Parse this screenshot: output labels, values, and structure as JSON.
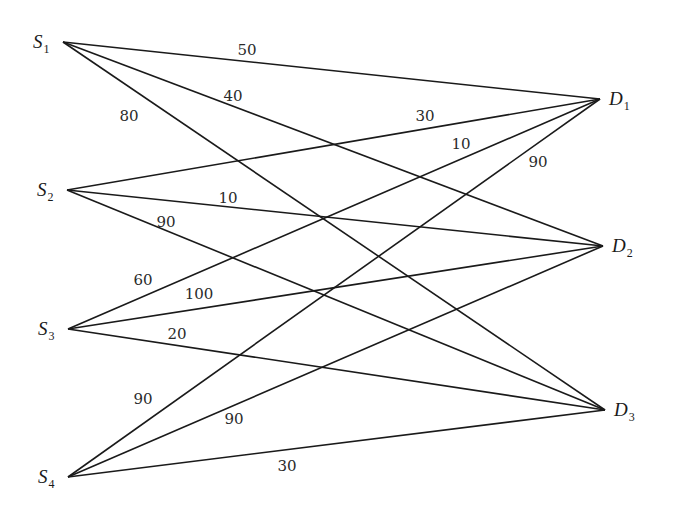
{
  "diagram": {
    "type": "bipartite-network",
    "sources": [
      {
        "id": "S1",
        "letter": "S",
        "sub": "1",
        "x": 63,
        "y": 42
      },
      {
        "id": "S2",
        "letter": "S",
        "sub": "2",
        "x": 67,
        "y": 190
      },
      {
        "id": "S3",
        "letter": "S",
        "sub": "3",
        "x": 68,
        "y": 329
      },
      {
        "id": "S4",
        "letter": "S",
        "sub": "4",
        "x": 68,
        "y": 477
      }
    ],
    "destinations": [
      {
        "id": "D1",
        "letter": "D",
        "sub": "1",
        "x": 600,
        "y": 99
      },
      {
        "id": "D2",
        "letter": "D",
        "sub": "2",
        "x": 603,
        "y": 246
      },
      {
        "id": "D3",
        "letter": "D",
        "sub": "3",
        "x": 605,
        "y": 410
      }
    ],
    "edges": [
      {
        "from": "S1",
        "to": "D1"
      },
      {
        "from": "S1",
        "to": "D2"
      },
      {
        "from": "S1",
        "to": "D3"
      },
      {
        "from": "S2",
        "to": "D1"
      },
      {
        "from": "S2",
        "to": "D2"
      },
      {
        "from": "S2",
        "to": "D3"
      },
      {
        "from": "S3",
        "to": "D1"
      },
      {
        "from": "S3",
        "to": "D2"
      },
      {
        "from": "S3",
        "to": "D3"
      },
      {
        "from": "S4",
        "to": "D1"
      },
      {
        "from": "S4",
        "to": "D2"
      },
      {
        "from": "S4",
        "to": "D3"
      }
    ],
    "labels": [
      {
        "text": "50",
        "x": 247,
        "y": 55
      },
      {
        "text": "40",
        "x": 233,
        "y": 101
      },
      {
        "text": "80",
        "x": 129,
        "y": 121
      },
      {
        "text": "30",
        "x": 425,
        "y": 121
      },
      {
        "text": "10",
        "x": 461,
        "y": 149
      },
      {
        "text": "90",
        "x": 538,
        "y": 167
      },
      {
        "text": "10",
        "x": 228,
        "y": 203
      },
      {
        "text": "90",
        "x": 166,
        "y": 227
      },
      {
        "text": "60",
        "x": 143,
        "y": 285
      },
      {
        "text": "100",
        "x": 199,
        "y": 299
      },
      {
        "text": "20",
        "x": 177,
        "y": 339
      },
      {
        "text": "90",
        "x": 143,
        "y": 404
      },
      {
        "text": "90",
        "x": 234,
        "y": 424
      },
      {
        "text": "30",
        "x": 287,
        "y": 471
      }
    ]
  }
}
